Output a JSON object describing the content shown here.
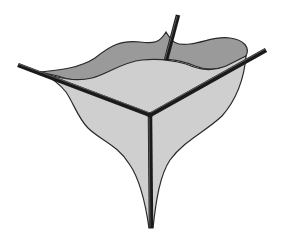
{
  "figure": {
    "colors": {
      "background": "#ffffff",
      "back_film": "#9a9a9a",
      "front_film": "#cfcfcf",
      "outline": "#2a2a2a",
      "rod": "#1a1a1a"
    },
    "rods": [
      {
        "name": "back",
        "x1": 178,
        "y1": 15,
        "x2": 166,
        "y2": 58
      },
      {
        "name": "left",
        "x1": 18,
        "y1": 65,
        "x2": 150,
        "y2": 115
      },
      {
        "name": "right",
        "x1": 266,
        "y1": 50,
        "x2": 150,
        "y2": 115
      },
      {
        "name": "bottom",
        "x1": 150,
        "y1": 115,
        "x2": 151,
        "y2": 228
      }
    ],
    "junction": {
      "x": 150,
      "y": 115
    }
  }
}
